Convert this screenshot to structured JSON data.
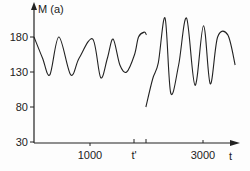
{
  "chart_data": {
    "type": "line",
    "title": "",
    "xlabel": "t",
    "ylabel": "M (a)",
    "xlim": [
      0,
      3600
    ],
    "ylim": [
      30,
      200
    ],
    "grid": false,
    "legend": null,
    "x_ticks": [
      {
        "value": 1000,
        "label": "1000"
      },
      {
        "value": 1980,
        "label": "t'"
      },
      {
        "value": 2000,
        "label": ""
      },
      {
        "value": 3000,
        "label": "3000"
      }
    ],
    "y_ticks": [
      {
        "value": 30,
        "label": "30"
      },
      {
        "value": 80,
        "label": "80"
      },
      {
        "value": 130,
        "label": "130"
      },
      {
        "value": 180,
        "label": "180"
      }
    ],
    "series": [
      {
        "name": "before t'",
        "x": [
          0,
          150,
          280,
          440,
          650,
          800,
          1040,
          1180,
          1300,
          1400,
          1520,
          1640,
          1780,
          1850,
          1950,
          1990
        ],
        "y": [
          180,
          150,
          126,
          180,
          126,
          150,
          177,
          122,
          150,
          177,
          140,
          130,
          155,
          180,
          187,
          183
        ]
      },
      {
        "name": "after t'",
        "x": [
          1980,
          2100,
          2200,
          2320,
          2420,
          2560,
          2700,
          2850,
          3000,
          3120,
          3250,
          3430,
          3560
        ],
        "y": [
          80,
          120,
          143,
          207,
          100,
          140,
          207,
          111,
          196,
          113,
          180,
          183,
          140
        ]
      }
    ]
  },
  "axis": {
    "y_title": "M (a)",
    "x_title": "t",
    "y_labels": [
      "180",
      "130",
      "80",
      "30"
    ],
    "x_labels": [
      "1000",
      "t'",
      "3000"
    ]
  }
}
